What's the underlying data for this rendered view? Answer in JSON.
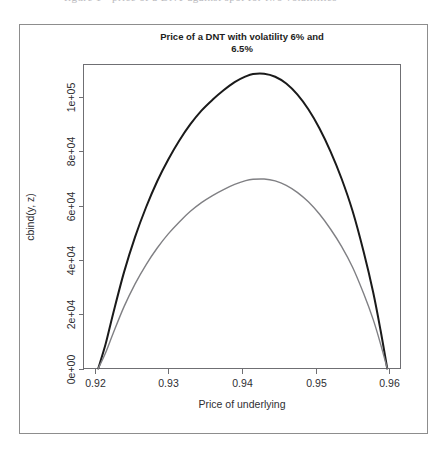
{
  "page": {
    "background_color": "#ffffff",
    "clipped_header_text": "figure   1   -   price   of   a   DNT   against   spot   for   two   volatilities"
  },
  "figure": {
    "border_color": "#8d8d8d",
    "axis_color": "#6f6f73",
    "text_color": "#2e2e32"
  },
  "chart_data": {
    "type": "line",
    "title": "Price of a DNT with volatility 6% and 6.5%",
    "title_line1": "Price of a DNT with volatility 6% and",
    "title_line2": "6.5%",
    "xlabel": "Price of underlying",
    "ylabel": "cbind(y, z)",
    "grid": false,
    "legend": "none",
    "xlim": [
      0.9185,
      0.9615
    ],
    "ylim": [
      0,
      112000
    ],
    "xticks": [
      0.92,
      0.93,
      0.94,
      0.95,
      0.96
    ],
    "xticklabels": [
      "0.92",
      "0.93",
      "0.94",
      "0.95",
      "0.96"
    ],
    "yticks": [
      0,
      20000,
      40000,
      60000,
      80000,
      100000
    ],
    "yticklabels": [
      "0e+00",
      "2e+04",
      "4e+04",
      "6e+04",
      "8e+04",
      "1e+05"
    ],
    "series": [
      {
        "name": "volatility 6%",
        "color": "#1a1a1a",
        "width": 2.0,
        "x": [
          0.9205,
          0.9215,
          0.9225,
          0.924,
          0.9255,
          0.927,
          0.9285,
          0.93,
          0.9315,
          0.933,
          0.9345,
          0.936,
          0.9375,
          0.939,
          0.9405,
          0.9415,
          0.943,
          0.9445,
          0.946,
          0.9475,
          0.949,
          0.9505,
          0.952,
          0.9535,
          0.955,
          0.9565,
          0.9578,
          0.9588,
          0.9597
        ],
        "y": [
          0,
          9000,
          20000,
          35500,
          48500,
          59500,
          69000,
          77000,
          84000,
          90000,
          95000,
          99000,
          102500,
          105500,
          107600,
          108500,
          108600,
          107500,
          105000,
          101000,
          95500,
          88500,
          80000,
          70000,
          58000,
          43000,
          28000,
          14000,
          0
        ]
      },
      {
        "name": "volatility 6.5%",
        "color": "#808084",
        "width": 1.4,
        "x": [
          0.9205,
          0.9215,
          0.9225,
          0.924,
          0.9255,
          0.927,
          0.9285,
          0.93,
          0.9315,
          0.933,
          0.9345,
          0.936,
          0.9375,
          0.939,
          0.9405,
          0.9415,
          0.943,
          0.9445,
          0.946,
          0.9475,
          0.949,
          0.9505,
          0.952,
          0.9535,
          0.955,
          0.9565,
          0.9578,
          0.9588,
          0.9597
        ],
        "y": [
          0,
          5800,
          12800,
          22800,
          31200,
          38300,
          44400,
          49600,
          54000,
          57900,
          61100,
          63700,
          65900,
          67800,
          69200,
          69700,
          69800,
          69100,
          67500,
          64900,
          61400,
          56900,
          51400,
          45000,
          37300,
          27600,
          18000,
          9000,
          0
        ]
      }
    ]
  }
}
